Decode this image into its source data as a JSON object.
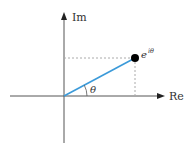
{
  "diagram": {
    "axes": {
      "horizontal_label": "Re",
      "vertical_label": "Im"
    },
    "point": {
      "label_base": "e",
      "label_exponent": "iθ",
      "color": "#000000"
    },
    "angle_label": "θ",
    "vector_color": "#3b9ad9",
    "axis_color": "#555555",
    "guide_color": "#aaaaaa"
  }
}
